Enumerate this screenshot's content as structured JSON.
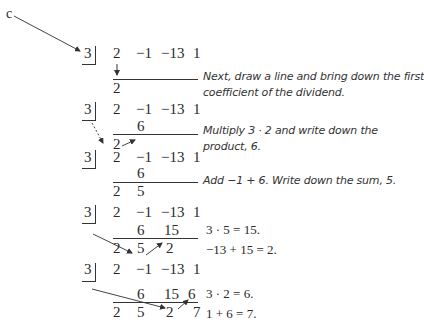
{
  "label_c": "c",
  "divisor": "3",
  "coefficients": [
    "2",
    "−1",
    "−13",
    "1"
  ],
  "steps": [
    {
      "products": [],
      "bottom": [
        "2"
      ],
      "notes": [
        "Next, draw a line and bring down the first",
        "coefficient of the dividend."
      ]
    },
    {
      "products": [
        "6"
      ],
      "bottom": [
        "2"
      ],
      "notes": [
        "Multiply 3 · 2 and write down the",
        "product, 6."
      ]
    },
    {
      "products": [
        "6"
      ],
      "bottom": [
        "2",
        "5"
      ],
      "notes": [
        "Add −1 + 6. Write down the sum, 5."
      ]
    },
    {
      "products": [
        "6",
        "15"
      ],
      "bottom": [
        "2",
        "5",
        "2"
      ],
      "notes": [
        "3 · 5 = 15.",
        "−13 + 15 = 2."
      ]
    },
    {
      "products": [
        "6",
        "15",
        "6"
      ],
      "bottom": [
        "2",
        "5",
        "2",
        "7"
      ],
      "notes": [
        "3 · 2 = 6.",
        "1 + 6 = 7."
      ]
    }
  ]
}
